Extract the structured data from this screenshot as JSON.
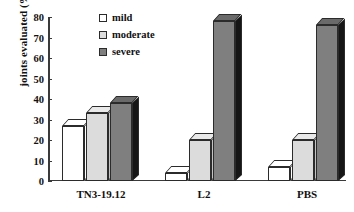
{
  "chart_data": {
    "type": "bar",
    "title": "",
    "subtitle": "",
    "xlabel": "",
    "ylabel": "joints evaluated (%)",
    "categories": [
      "TN3-19.12",
      "L2",
      "PBS"
    ],
    "series": [
      {
        "name": "mild",
        "values": [
          27,
          4,
          7
        ],
        "color": "#ffffff"
      },
      {
        "name": "moderate",
        "values": [
          33,
          20,
          20
        ],
        "color": "#dcdcdc"
      },
      {
        "name": "severe",
        "values": [
          38,
          78,
          76
        ],
        "color": "#7f7f7f"
      }
    ],
    "ylim": [
      0,
      80
    ],
    "yticks": [
      0,
      10,
      20,
      30,
      40,
      50,
      60,
      70,
      80
    ],
    "ytick_labels": [
      "0",
      "10",
      "20",
      "30",
      "40",
      "50",
      "60",
      "70",
      "80"
    ],
    "grid": false,
    "legend_position": "upper-left-inside",
    "style": "3d-bars",
    "background": "#ffffff",
    "axis_color": "#3a3a3a",
    "text_color": "#111111"
  },
  "legend": {
    "items": [
      {
        "label": "mild",
        "swatch": "legend-swatch-mild"
      },
      {
        "label": "moderate",
        "swatch": "legend-swatch-moderate"
      },
      {
        "label": "severe",
        "swatch": "legend-swatch-severe"
      }
    ]
  }
}
